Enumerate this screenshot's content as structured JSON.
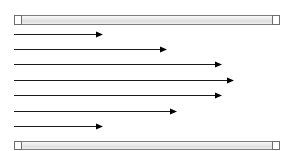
{
  "figure": {
    "type": "vector-field-diagram",
    "canvas": {
      "width": 292,
      "height": 151,
      "background": "#ffffff"
    },
    "colors": {
      "plate_fill_light": "#f2f2f2",
      "plate_fill_mid": "#d9d9d9",
      "plate_border": "#7d7d7d",
      "arrow_stroke": "#1a1a1a",
      "arrow_head": "#000000",
      "background": "#ffffff"
    }
  },
  "plates": [
    {
      "name": "top-plate",
      "label": "Top plate",
      "x": 14,
      "y": 15,
      "width": 265,
      "height": 9,
      "cap_width": 7
    },
    {
      "name": "bottom-plate",
      "label": "Bottom plate",
      "x": 14,
      "y": 141,
      "width": 265,
      "height": 8,
      "cap_width": 7
    }
  ],
  "arrows": [
    {
      "index": 1,
      "label": "v1",
      "x_start": 14,
      "x_tip": 103,
      "y": 34,
      "length": 89
    },
    {
      "index": 2,
      "label": "v2",
      "x_start": 14,
      "x_tip": 167,
      "y": 49,
      "length": 153
    },
    {
      "index": 3,
      "label": "v3",
      "x_start": 14,
      "x_tip": 222,
      "y": 64,
      "length": 208
    },
    {
      "index": 4,
      "label": "v4",
      "x_start": 14,
      "x_tip": 234,
      "y": 80,
      "length": 220
    },
    {
      "index": 5,
      "label": "v5",
      "x_start": 14,
      "x_tip": 222,
      "y": 95,
      "length": 208
    },
    {
      "index": 6,
      "label": "v6",
      "x_start": 14,
      "x_tip": 177,
      "y": 111,
      "length": 163
    },
    {
      "index": 7,
      "label": "v7",
      "x_start": 14,
      "x_tip": 103,
      "y": 126,
      "length": 89
    }
  ],
  "chart_data": {
    "type": "bar",
    "orientation": "horizontal",
    "xlabel": "",
    "ylabel": "",
    "categories": [
      "v1",
      "v2",
      "v3",
      "v4",
      "v5",
      "v6",
      "v7"
    ],
    "values": [
      89,
      153,
      208,
      220,
      208,
      163,
      89
    ],
    "xlim": [
      0,
      265
    ],
    "grid": false,
    "legend": null,
    "annotations": [
      "Top plate boundary",
      "Bottom plate boundary"
    ]
  }
}
